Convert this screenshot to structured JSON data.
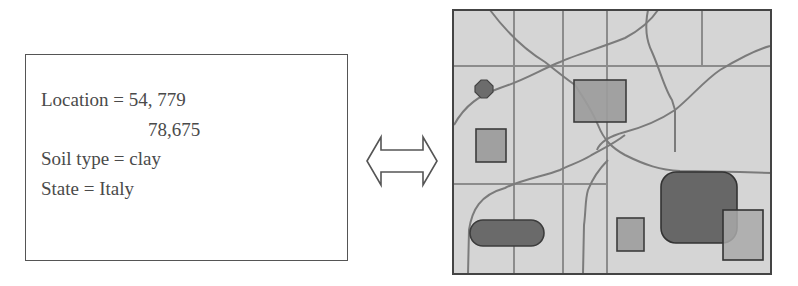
{
  "attributes": {
    "location_label": "Location = 54, 779",
    "location_cont": "78,675",
    "soil": "Soil type = clay",
    "state": "State = Italy"
  },
  "connector": {
    "icon": "double-headed-arrow-icon"
  },
  "map": {
    "description": "raster/vector map with grid cells, rivers and polygon features",
    "colors": {
      "background": "#d5d5d5",
      "grid": "#8c8c8c",
      "border": "#444444",
      "river": "#7d7d7d",
      "dark_feature": "#686868",
      "medium_feature": "#9d9d9d",
      "light_feature": "#a9a9a9"
    }
  }
}
